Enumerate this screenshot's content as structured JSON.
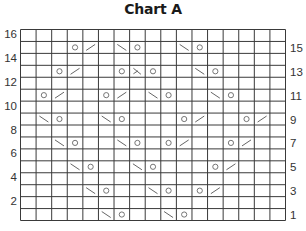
{
  "title": "Chart A",
  "chart_data": {
    "type": "table",
    "title": "Chart A",
    "columns": 17,
    "rows": 16,
    "left_row_labels": [
      "16",
      "14",
      "12",
      "10",
      "8",
      "6",
      "4",
      "2"
    ],
    "right_row_labels": [
      "15",
      "13",
      "11",
      "9",
      "7",
      "5",
      "3",
      "1"
    ],
    "symbols": {
      "yo": "circle (yarn over)",
      "k2tog": "/ (right-leaning decrease)",
      "ssk": "\\ (left-leaning decrease)",
      "sk2p": "⋋ (double decrease)"
    },
    "cells": {
      "15": [
        {
          "col": 4,
          "sym": "yo"
        },
        {
          "col": 5,
          "sym": "k2tog"
        },
        {
          "col": 7,
          "sym": "ssk"
        },
        {
          "col": 8,
          "sym": "yo"
        },
        {
          "col": 11,
          "sym": "ssk"
        },
        {
          "col": 12,
          "sym": "yo"
        }
      ],
      "13": [
        {
          "col": 3,
          "sym": "yo"
        },
        {
          "col": 4,
          "sym": "k2tog"
        },
        {
          "col": 7,
          "sym": "yo"
        },
        {
          "col": 8,
          "sym": "sk2p"
        },
        {
          "col": 9,
          "sym": "yo"
        },
        {
          "col": 12,
          "sym": "ssk"
        },
        {
          "col": 13,
          "sym": "yo"
        }
      ],
      "11": [
        {
          "col": 2,
          "sym": "yo"
        },
        {
          "col": 3,
          "sym": "k2tog"
        },
        {
          "col": 6,
          "sym": "yo"
        },
        {
          "col": 7,
          "sym": "k2tog"
        },
        {
          "col": 9,
          "sym": "ssk"
        },
        {
          "col": 10,
          "sym": "yo"
        },
        {
          "col": 13,
          "sym": "ssk"
        },
        {
          "col": 14,
          "sym": "yo"
        }
      ],
      "9": [
        {
          "col": 2,
          "sym": "ssk"
        },
        {
          "col": 3,
          "sym": "yo"
        },
        {
          "col": 6,
          "sym": "ssk"
        },
        {
          "col": 7,
          "sym": "yo"
        },
        {
          "col": 11,
          "sym": "yo"
        },
        {
          "col": 12,
          "sym": "k2tog"
        },
        {
          "col": 15,
          "sym": "yo"
        },
        {
          "col": 16,
          "sym": "k2tog"
        }
      ],
      "7": [
        {
          "col": 3,
          "sym": "ssk"
        },
        {
          "col": 4,
          "sym": "yo"
        },
        {
          "col": 7,
          "sym": "ssk"
        },
        {
          "col": 8,
          "sym": "yo"
        },
        {
          "col": 10,
          "sym": "yo"
        },
        {
          "col": 11,
          "sym": "k2tog"
        },
        {
          "col": 14,
          "sym": "yo"
        },
        {
          "col": 15,
          "sym": "k2tog"
        }
      ],
      "5": [
        {
          "col": 4,
          "sym": "ssk"
        },
        {
          "col": 5,
          "sym": "yo"
        },
        {
          "col": 8,
          "sym": "ssk"
        },
        {
          "col": 9,
          "sym": "yo"
        },
        {
          "col": 13,
          "sym": "yo"
        },
        {
          "col": 14,
          "sym": "k2tog"
        }
      ],
      "3": [
        {
          "col": 5,
          "sym": "ssk"
        },
        {
          "col": 6,
          "sym": "yo"
        },
        {
          "col": 9,
          "sym": "ssk"
        },
        {
          "col": 10,
          "sym": "yo"
        },
        {
          "col": 12,
          "sym": "yo"
        },
        {
          "col": 13,
          "sym": "k2tog"
        }
      ],
      "1": [
        {
          "col": 6,
          "sym": "ssk"
        },
        {
          "col": 7,
          "sym": "yo"
        },
        {
          "col": 10,
          "sym": "ssk"
        },
        {
          "col": 11,
          "sym": "yo"
        }
      ]
    },
    "colors": {
      "grid": "#3a3a3a",
      "symbol": "#666666",
      "label": "#333333"
    }
  }
}
